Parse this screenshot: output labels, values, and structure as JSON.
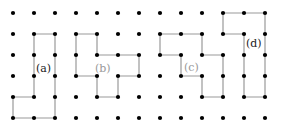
{
  "figure": {
    "grid": {
      "cols": 13,
      "rows": 6,
      "origin_x": 13,
      "origin_y": 13,
      "spacing": 21
    },
    "colors": {
      "dot": "#000000",
      "line": "#9a9a9a",
      "label_dark": "#222222",
      "label_light": "#999999"
    },
    "polygons": [
      {
        "id": "a",
        "label": "(a)",
        "label_x": 36,
        "label_y": 72,
        "label_color": "#222222",
        "points": [
          [
            1,
            1
          ],
          [
            2,
            1
          ],
          [
            2,
            5
          ],
          [
            0,
            5
          ],
          [
            0,
            4
          ],
          [
            1,
            4
          ],
          [
            1,
            1
          ]
        ]
      },
      {
        "id": "b",
        "label": "(b)",
        "label_x": 95,
        "label_y": 72,
        "label_color": "#999999",
        "points": [
          [
            3,
            1
          ],
          [
            4,
            1
          ],
          [
            4,
            2
          ],
          [
            6,
            2
          ],
          [
            6,
            3
          ],
          [
            5,
            3
          ],
          [
            5,
            4
          ],
          [
            4,
            4
          ],
          [
            4,
            3
          ],
          [
            3,
            3
          ],
          [
            3,
            1
          ]
        ]
      },
      {
        "id": "c",
        "label": "(c)",
        "label_x": 184,
        "label_y": 71,
        "label_color": "#999999",
        "points": [
          [
            7,
            1
          ],
          [
            9,
            1
          ],
          [
            9,
            2
          ],
          [
            10,
            2
          ],
          [
            10,
            4
          ],
          [
            9,
            4
          ],
          [
            9,
            3
          ],
          [
            8,
            3
          ],
          [
            8,
            2
          ],
          [
            7,
            2
          ],
          [
            7,
            1
          ]
        ]
      },
      {
        "id": "d",
        "label": "(d)",
        "label_x": 246,
        "label_y": 47,
        "label_color": "#222222",
        "points": [
          [
            10,
            0
          ],
          [
            12,
            0
          ],
          [
            12,
            4
          ],
          [
            11,
            4
          ],
          [
            11,
            1
          ],
          [
            10,
            1
          ],
          [
            10,
            0
          ]
        ]
      }
    ]
  }
}
